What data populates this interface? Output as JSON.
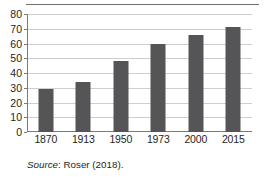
{
  "chart_data": {
    "type": "bar",
    "title": "",
    "xlabel": "",
    "ylabel": "",
    "categories": [
      "1870",
      "1913",
      "1950",
      "1973",
      "2000",
      "2015"
    ],
    "values": [
      29.5,
      34,
      48,
      59.5,
      66,
      71
    ],
    "ylim": [
      0,
      80
    ],
    "yticks": [
      0,
      10,
      20,
      30,
      40,
      50,
      60,
      70,
      80
    ],
    "ytick_labels": [
      "0",
      "10",
      "20",
      "30",
      "40",
      "50",
      "60",
      "70",
      "80"
    ],
    "grid": true,
    "legend": false,
    "bar_color": "#555456",
    "gridline_color": "#cfcfcf",
    "axis_color": "#7a7a7a"
  },
  "source_note": {
    "label": "Source",
    "text": ": Roser (2018)."
  }
}
